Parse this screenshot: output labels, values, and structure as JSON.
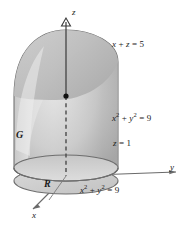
{
  "figure": {
    "background_color": "#ffffff",
    "width": 187,
    "height": 226
  },
  "axes": {
    "z": {
      "label": "z",
      "direction": "up"
    },
    "y": {
      "label": "y",
      "direction": "right"
    },
    "x": {
      "label": "x",
      "direction": "down-left"
    },
    "color": "#555555"
  },
  "labels": {
    "plane_top": {
      "text": "x + z = 5",
      "lhs_var1": "x",
      "operator": "+",
      "lhs_var2": "z",
      "equals": "=",
      "value": "5"
    },
    "cylinder_upper": {
      "text": "x2 + y2 = 9",
      "var1": "x",
      "exp1": "2",
      "operator": "+",
      "var2": "y",
      "exp2": "2",
      "equals": "=",
      "value": "9"
    },
    "plane_bottom": {
      "text": "z = 1",
      "var": "z",
      "equals": "=",
      "value": "1"
    },
    "cylinder_lower": {
      "text": "x2 + y2 = 9",
      "var1": "x",
      "exp1": "2",
      "operator": "+",
      "var2": "y",
      "exp2": "2",
      "equals": "=",
      "value": "9"
    },
    "solid": {
      "text": "G"
    },
    "region": {
      "text": "R"
    }
  },
  "colors": {
    "surface_light": "#dcdcdc",
    "surface_mid": "#bdbdbd",
    "surface_dark": "#9a9a9a",
    "outline": "#6e6e6e",
    "axis": "#555555",
    "text": "#1a1a1a",
    "base_fill": "#cfcfcf"
  },
  "geometry": {
    "cylinder_radius_px": 52,
    "center_x_px": 66,
    "base_ellipse_center_y_px": 181,
    "top_ellipse_center_y_px": 168,
    "ellipse_ry_px": 13,
    "cylinder_top_y_px": 30,
    "z_axis_top_y_px": 22
  }
}
